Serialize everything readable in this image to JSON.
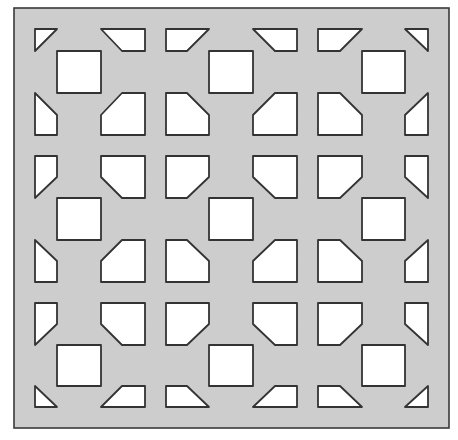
{
  "diagram": {
    "type": "perforated-panel-pattern",
    "canvas": {
      "width": 458,
      "height": 440,
      "background": "#ffffff"
    },
    "panel": {
      "x": 14,
      "y": 8,
      "width": 435,
      "height": 420,
      "fill": "#cdcdcd",
      "stroke": "#3a3a3a"
    },
    "hole_style": {
      "fill": "#ffffff",
      "stroke": "#333333"
    },
    "holes": [
      {
        "name": "triangle-top-left",
        "points": "35,29 57,29 35,51"
      },
      {
        "name": "trapezoid-top-1",
        "points": "101,29 145,29 145,51 122,51"
      },
      {
        "name": "trapezoid-top-2",
        "points": "166,29 209,29 187,51 166,51"
      },
      {
        "name": "trapezoid-top-3",
        "points": "253,29 297,29 297,51 275,51"
      },
      {
        "name": "trapezoid-top-4",
        "points": "318,29 362,29 340,51 318,51"
      },
      {
        "name": "triangle-top-right",
        "points": "405,29 428,29 428,51"
      },
      {
        "name": "square-r1-c1",
        "points": "57,51 101,51 101,93 57,93"
      },
      {
        "name": "square-r1-c2",
        "points": "209,51 253,51 253,93 209,93"
      },
      {
        "name": "square-r1-c3",
        "points": "362,51 405,51 405,93 362,93"
      },
      {
        "name": "pentagon-r2-left-edge",
        "points": "35,93 57,115 57,135 35,135"
      },
      {
        "name": "pentagon-r2-1",
        "points": "122,93 145,93 145,135 101,135 101,115"
      },
      {
        "name": "pentagon-r2-2",
        "points": "166,93 187,93 209,115 209,135 166,135"
      },
      {
        "name": "pentagon-r2-3",
        "points": "275,93 297,93 297,135 253,135 253,115"
      },
      {
        "name": "pentagon-r2-4",
        "points": "318,93 340,93 362,115 362,135 318,135"
      },
      {
        "name": "pentagon-r2-right-edge",
        "points": "428,93 428,135 405,135 405,115"
      },
      {
        "name": "pentagon-r3-left-edge",
        "points": "35,156 57,156 57,177 35,198"
      },
      {
        "name": "pentagon-r3-1",
        "points": "101,156 145,156 145,198 122,198 101,177"
      },
      {
        "name": "pentagon-r3-2",
        "points": "166,156 209,156 209,177 187,198 166,198"
      },
      {
        "name": "pentagon-r3-3",
        "points": "253,156 297,156 297,198 275,198 253,177"
      },
      {
        "name": "pentagon-r3-4",
        "points": "318,156 362,156 362,177 340,198 318,198"
      },
      {
        "name": "pentagon-r3-right-edge",
        "points": "405,156 428,156 428,198 405,177"
      },
      {
        "name": "square-r4-c1",
        "points": "57,198 101,198 101,240 57,240"
      },
      {
        "name": "square-r4-c2",
        "points": "209,198 253,198 253,240 209,240"
      },
      {
        "name": "square-r4-c3",
        "points": "362,198 405,198 405,240 362,240"
      },
      {
        "name": "pentagon-r5-left-edge",
        "points": "35,240 57,261 57,282 35,282"
      },
      {
        "name": "pentagon-r5-1",
        "points": "122,240 145,240 145,282 101,282 101,261"
      },
      {
        "name": "pentagon-r5-2",
        "points": "166,240 187,240 209,261 209,282 166,282"
      },
      {
        "name": "pentagon-r5-3",
        "points": "275,240 297,240 297,282 253,282 253,261"
      },
      {
        "name": "pentagon-r5-4",
        "points": "318,240 340,240 362,261 362,282 318,282"
      },
      {
        "name": "pentagon-r5-right-edge",
        "points": "428,240 428,282 405,282 405,261"
      },
      {
        "name": "pentagon-r6-left-edge",
        "points": "35,303 57,303 57,324 35,345"
      },
      {
        "name": "pentagon-r6-1",
        "points": "101,303 145,303 145,345 122,345 101,324"
      },
      {
        "name": "pentagon-r6-2",
        "points": "166,303 209,303 209,324 187,345 166,345"
      },
      {
        "name": "pentagon-r6-3",
        "points": "253,303 297,303 297,345 275,345 253,324"
      },
      {
        "name": "pentagon-r6-4",
        "points": "318,303 362,303 362,324 340,345 318,345"
      },
      {
        "name": "pentagon-r6-right-edge",
        "points": "405,303 428,303 428,345 405,324"
      },
      {
        "name": "square-r7-c1",
        "points": "57,345 101,345 101,386 57,386"
      },
      {
        "name": "square-r7-c2",
        "points": "209,345 253,345 253,386 209,386"
      },
      {
        "name": "square-r7-c3",
        "points": "362,345 405,345 405,386 362,386"
      },
      {
        "name": "triangle-bottom-left",
        "points": "35,386 57,407 35,407"
      },
      {
        "name": "trapezoid-bottom-1",
        "points": "122,386 145,386 145,407 101,407"
      },
      {
        "name": "trapezoid-bottom-2",
        "points": "166,386 187,386 209,407 166,407"
      },
      {
        "name": "trapezoid-bottom-3",
        "points": "275,386 297,386 297,407 253,407"
      },
      {
        "name": "trapezoid-bottom-4",
        "points": "318,386 340,386 362,407 318,407"
      },
      {
        "name": "triangle-bottom-right",
        "points": "428,386 428,407 405,407"
      }
    ]
  }
}
